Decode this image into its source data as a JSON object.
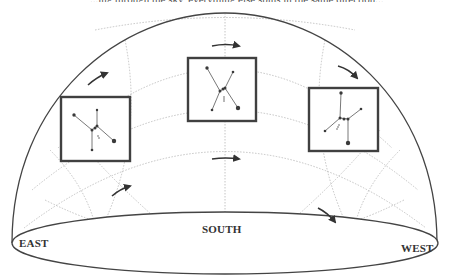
{
  "labels": {
    "east": "EAST",
    "south": "SOUTH",
    "west": "WEST"
  },
  "top_cut_text": "...ing through the sky, everything else spins in the same direction...",
  "colors": {
    "outline": "#444444",
    "grid": "#b5b5b5",
    "box": "#404040",
    "star": "#3a3a3a",
    "background": "#ffffff"
  },
  "constellation": {
    "name": "Orion",
    "positions": [
      "rising-east",
      "culminating-south",
      "setting-west"
    ]
  },
  "arrows": {
    "upper_row": [
      "east-rising",
      "south-top",
      "west-setting"
    ],
    "lower_row": [
      "east-rising",
      "south-top",
      "west-setting"
    ]
  }
}
